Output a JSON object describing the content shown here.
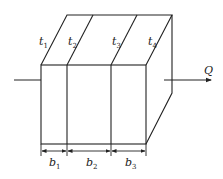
{
  "diagram": {
    "type": "multilayer-wall-heat-conduction",
    "surface_temperatures": [
      {
        "symbol": "t",
        "sub": "1"
      },
      {
        "symbol": "t",
        "sub": "2"
      },
      {
        "symbol": "t",
        "sub": "3"
      },
      {
        "symbol": "t",
        "sub": "4"
      }
    ],
    "thicknesses": [
      {
        "symbol": "b",
        "sub": "1"
      },
      {
        "symbol": "b",
        "sub": "2"
      },
      {
        "symbol": "b",
        "sub": "3"
      }
    ],
    "heat_flow_label": "Q",
    "colors": {
      "line": "#222222",
      "background": "#ffffff"
    }
  }
}
